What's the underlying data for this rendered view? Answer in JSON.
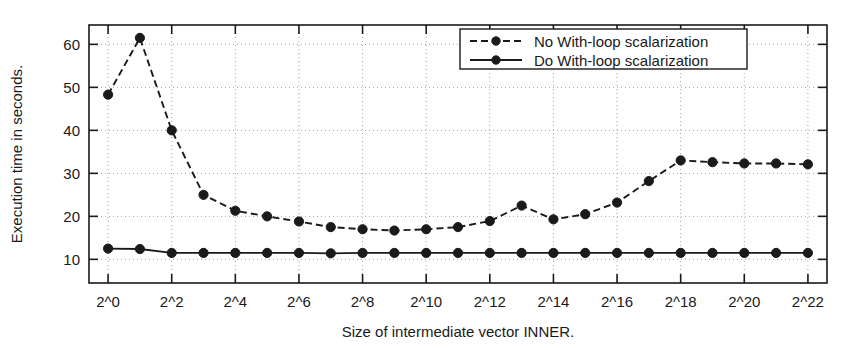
{
  "chart_data": {
    "type": "line",
    "title": "",
    "xlabel": "Size of intermediate vector INNER.",
    "ylabel": "Execution time in seconds.",
    "x": [
      "2^0",
      "2^1",
      "2^2",
      "2^3",
      "2^4",
      "2^5",
      "2^6",
      "2^7",
      "2^8",
      "2^9",
      "2^10",
      "2^11",
      "2^12",
      "2^13",
      "2^14",
      "2^15",
      "2^16",
      "2^17",
      "2^18",
      "2^19",
      "2^20",
      "2^21",
      "2^22"
    ],
    "xtick_labels": [
      "2^0",
      "2^2",
      "2^4",
      "2^6",
      "2^8",
      "2^10",
      "2^12",
      "2^14",
      "2^16",
      "2^18",
      "2^20",
      "2^22"
    ],
    "xtick_indices": [
      0,
      2,
      4,
      6,
      8,
      10,
      12,
      14,
      16,
      18,
      20,
      22
    ],
    "ytick_labels": [
      "10",
      "20",
      "30",
      "40",
      "50",
      "60"
    ],
    "ytick_values": [
      10,
      20,
      30,
      40,
      50,
      60
    ],
    "ylim": [
      4.5,
      64.5
    ],
    "grid": true,
    "legend_position": "top-right",
    "series": [
      {
        "name": "No With-loop scalarization",
        "style": "dashed",
        "marker": "filled-circle",
        "color": "#1a1a1a",
        "values": [
          48.3,
          61.5,
          40.0,
          25.0,
          21.3,
          20.0,
          18.8,
          17.5,
          17.0,
          16.7,
          17.0,
          17.5,
          18.9,
          22.5,
          19.3,
          20.5,
          23.2,
          28.2,
          33.0,
          32.6,
          32.3,
          32.3,
          32.1
        ]
      },
      {
        "name": "Do With-loop scalarization",
        "style": "solid",
        "marker": "filled-circle",
        "color": "#1a1a1a",
        "values": [
          12.5,
          12.4,
          11.5,
          11.5,
          11.5,
          11.5,
          11.5,
          11.4,
          11.5,
          11.5,
          11.5,
          11.5,
          11.5,
          11.5,
          11.5,
          11.5,
          11.5,
          11.5,
          11.5,
          11.5,
          11.5,
          11.5,
          11.5
        ]
      }
    ]
  },
  "legend": {
    "entries": [
      {
        "label": "No With-loop scalarization",
        "style": "dashed"
      },
      {
        "label": "Do With-loop scalarization",
        "style": "solid"
      }
    ]
  },
  "axes": {
    "x_title": "Size of intermediate vector INNER.",
    "y_title": "Execution time in seconds."
  }
}
